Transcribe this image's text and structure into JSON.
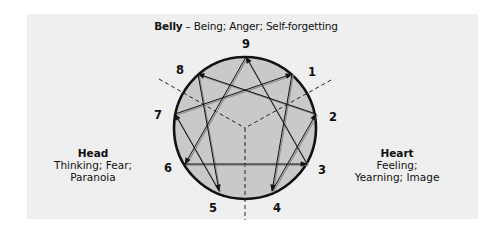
{
  "title": {
    "bold": "Belly",
    "rest": " – Being; Anger; Self-forgetting"
  },
  "centers": {
    "head": {
      "label": "Head",
      "line1": "Thinking; Fear;",
      "line2": "Paranoia"
    },
    "heart": {
      "label": "Heart",
      "line1": "Feeling;",
      "line2": "Yearning; Image"
    }
  },
  "points": [
    {
      "num": "9",
      "x": 246,
      "y": 44
    },
    {
      "num": "1",
      "x": 312,
      "y": 72
    },
    {
      "num": "2",
      "x": 333,
      "y": 117
    },
    {
      "num": "3",
      "x": 322,
      "y": 170
    },
    {
      "num": "4",
      "x": 277,
      "y": 208
    },
    {
      "num": "5",
      "x": 213,
      "y": 208
    },
    {
      "num": "6",
      "x": 168,
      "y": 168
    },
    {
      "num": "7",
      "x": 158,
      "y": 115
    },
    {
      "num": "8",
      "x": 180,
      "y": 70
    }
  ],
  "colors": {
    "panel": "#efefef",
    "circle_fill": "#c9c9c9",
    "stroke": "#111111"
  }
}
